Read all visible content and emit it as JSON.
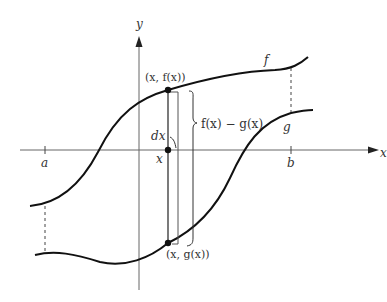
{
  "figure": {
    "axis_labels": {
      "x": "x",
      "y": "y"
    },
    "ticks": {
      "a": "a",
      "b": "b"
    },
    "curve_labels": {
      "f": "f",
      "g": "g"
    },
    "point_labels": {
      "top": "(x, f(x))",
      "bottom": "(x, g(x))",
      "axis": "x"
    },
    "strip_width_label": "dx",
    "height_label": "f(x) − g(x)",
    "colors": {
      "curve": "#111111",
      "axis": "#555555",
      "text": "#333333",
      "background": "#ffffff"
    }
  }
}
